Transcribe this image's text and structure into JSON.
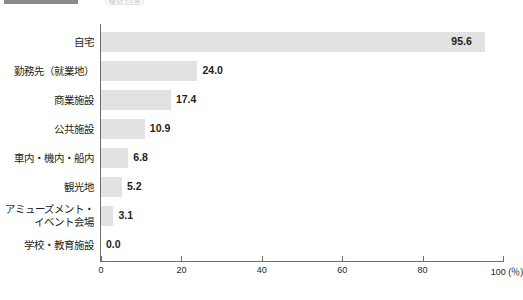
{
  "header": {
    "swatch_color": "#8a8a8a",
    "caption": "（複数回答）"
  },
  "chart_data": {
    "type": "bar",
    "orientation": "horizontal",
    "title": "",
    "subtitle": "",
    "xlabel": "(％)",
    "ylabel": "",
    "xlim": [
      0,
      100
    ],
    "xticks": [
      0,
      20,
      40,
      60,
      80,
      100
    ],
    "xticklabels": [
      "0",
      "20",
      "40",
      "60",
      "80",
      "100 (％)"
    ],
    "grid": false,
    "legend": [],
    "bar_color": "#e2e2e2",
    "axis_color": "#6d6d6d",
    "categories": [
      "自宅",
      "勤務先（就業地）",
      "商業施設",
      "公共施設",
      "車内・機内・船内",
      "観光地",
      "アミューズメント・\nイベント会場",
      "学校・教育施設"
    ],
    "values": [
      95.6,
      24.0,
      17.4,
      10.9,
      6.8,
      5.2,
      3.1,
      0.0
    ],
    "value_labels": [
      "95.6",
      "24.0",
      "17.4",
      "10.9",
      "6.8",
      "5.2",
      "3.1",
      "0.0"
    ]
  }
}
